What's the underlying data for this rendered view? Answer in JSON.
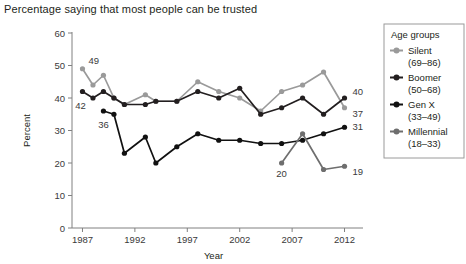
{
  "chart_data": {
    "type": "line",
    "title": "Percentage saying that most people can be trusted",
    "xlabel": "Year",
    "ylabel": "Percent",
    "xlim": [
      1986,
      2013
    ],
    "ylim": [
      0,
      60
    ],
    "ytick_labels": [
      "0",
      "10",
      "20",
      "30",
      "40",
      "50",
      "60"
    ],
    "yticks": [
      0,
      10,
      20,
      30,
      40,
      50,
      60
    ],
    "xtick_labels": [
      "1987",
      "1992",
      "1997",
      "2002",
      "2007",
      "2012"
    ],
    "xticks": [
      1987,
      1992,
      1997,
      2002,
      2007,
      2012
    ],
    "grid": false,
    "legend_position": "right-outside",
    "legend_title": "Age groups",
    "series": [
      {
        "name": "Silent",
        "range": "(69–86)",
        "legend_label": "Silent",
        "legend_sub": "(69–86)",
        "color": "#9a9a9a",
        "x": [
          1987,
          1988,
          1989,
          1990,
          1991,
          1993,
          1994,
          1996,
          1998,
          2000,
          2002,
          2004,
          2006,
          2008,
          2010,
          2012
        ],
        "values": [
          49,
          44,
          47,
          40,
          38,
          41,
          39,
          39,
          45,
          42,
          40,
          36,
          42,
          44,
          48,
          37
        ]
      },
      {
        "name": "Boomer",
        "range": "(50–68)",
        "legend_label": "Boomer",
        "legend_sub": "(50–68)",
        "color": "#231f20",
        "x": [
          1987,
          1988,
          1989,
          1990,
          1991,
          1993,
          1994,
          1996,
          1998,
          2000,
          2002,
          2004,
          2006,
          2008,
          2010,
          2012
        ],
        "values": [
          42,
          40,
          42,
          40,
          38,
          38,
          39,
          39,
          42,
          40,
          43,
          35,
          37,
          40,
          35,
          40
        ]
      },
      {
        "name": "Gen X",
        "range": "(33–49)",
        "legend_label": "Gen X",
        "legend_sub": "(33–49)",
        "color": "#111111",
        "x": [
          1989,
          1990,
          1991,
          1993,
          1994,
          1996,
          1998,
          2000,
          2002,
          2004,
          2006,
          2008,
          2010,
          2012
        ],
        "values": [
          36,
          35,
          23,
          28,
          20,
          25,
          29,
          27,
          27,
          26,
          26,
          27,
          29,
          31
        ]
      },
      {
        "name": "Millennial",
        "range": "(18–33)",
        "legend_label": "Millennial",
        "legend_sub": "(18–33)",
        "color": "#6e6e6e",
        "x": [
          2006,
          2008,
          2010,
          2012
        ],
        "values": [
          20,
          29,
          18,
          19
        ]
      }
    ],
    "annotations": [
      {
        "text": "49",
        "series": "Silent",
        "x": 1987,
        "value": 49
      },
      {
        "text": "42",
        "series": "Boomer",
        "x": 1987,
        "value": 42
      },
      {
        "text": "36",
        "series": "Gen X",
        "x": 1989,
        "value": 36
      },
      {
        "text": "20",
        "series": "Millennial",
        "x": 2006,
        "value": 20
      },
      {
        "text": "40",
        "series": "Boomer",
        "x": 2012,
        "value": 40
      },
      {
        "text": "37",
        "series": "Silent",
        "x": 2012,
        "value": 37
      },
      {
        "text": "31",
        "series": "Gen X",
        "x": 2012,
        "value": 31
      },
      {
        "text": "19",
        "series": "Millennial",
        "x": 2012,
        "value": 19
      }
    ]
  }
}
